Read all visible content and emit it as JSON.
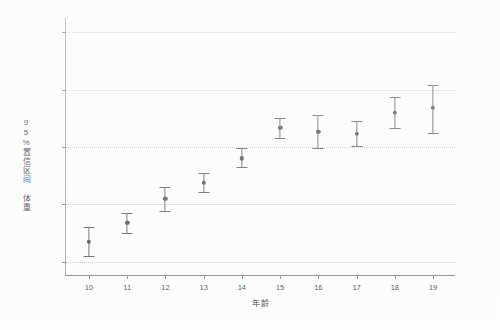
{
  "chart_data": {
    "type": "scatter",
    "title": "",
    "xlabel": "年龄",
    "ylabel": "95%置信区间 体重",
    "x": [
      10,
      11,
      12,
      13,
      14,
      15,
      16,
      17,
      18,
      19
    ],
    "xticklabels": [
      "10",
      "11",
      "12",
      "13",
      "14",
      "15",
      "16",
      "17",
      "18",
      "19"
    ],
    "yticklabels": [
      "30.0",
      "40.0",
      "50.0",
      "60.0",
      "70.0"
    ],
    "ytickvalues": [
      30.0,
      40.0,
      50.0,
      60.0,
      70.0
    ],
    "xlim": [
      9.4,
      19.6
    ],
    "ylim": [
      27.5,
      72.5
    ],
    "grid": true,
    "legend": false,
    "marker": "circle",
    "errorbar_kind": "95% confidence interval",
    "series": [
      {
        "name": "体重均值",
        "values": [
          33.5,
          36.8,
          41.0,
          43.8,
          48.0,
          53.3,
          52.7,
          52.3,
          56.0,
          56.8
        ],
        "ci_lower": [
          31.0,
          35.0,
          38.8,
          42.2,
          46.5,
          51.5,
          49.8,
          50.2,
          53.3,
          52.5
        ],
        "ci_upper": [
          36.0,
          38.5,
          43.0,
          45.5,
          49.8,
          55.0,
          55.5,
          54.5,
          58.8,
          60.8
        ]
      }
    ],
    "points": [
      {
        "x": "10",
        "mean": 33.5,
        "low": 31.0,
        "high": 36.0
      },
      {
        "x": "11",
        "mean": 36.8,
        "low": 35.0,
        "high": 38.5
      },
      {
        "x": "12",
        "mean": 41.0,
        "low": 38.8,
        "high": 43.0
      },
      {
        "x": "13",
        "mean": 43.8,
        "low": 42.2,
        "high": 45.5
      },
      {
        "x": "14",
        "mean": 48.0,
        "low": 46.5,
        "high": 49.8
      },
      {
        "x": "15",
        "mean": 53.3,
        "low": 51.5,
        "high": 55.0
      },
      {
        "x": "16",
        "mean": 52.7,
        "low": 49.8,
        "high": 55.5
      },
      {
        "x": "17",
        "mean": 52.3,
        "low": 50.2,
        "high": 54.5
      },
      {
        "x": "18",
        "mean": 56.0,
        "low": 53.3,
        "high": 58.8
      },
      {
        "x": "19",
        "mean": 56.8,
        "low": 52.5,
        "high": 60.8
      }
    ],
    "colors": {
      "marker": "#5a5a5a",
      "errorbar": "#6b6b6b",
      "grid": "#c9c9c9",
      "axis": "#8f8f8f",
      "tick_text": "#5b5b5b",
      "background": "#fdfdfd"
    }
  }
}
